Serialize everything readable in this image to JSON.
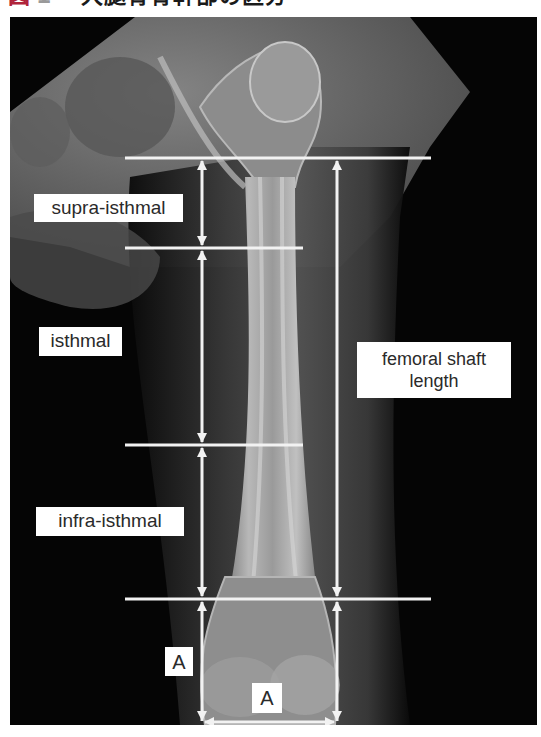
{
  "caption": {
    "marker": "図",
    "number": "1",
    "title": "大腿骨骨幹部の区分",
    "marker_color": "#b0243a"
  },
  "figure": {
    "type": "radiograph",
    "line_color": "#f2f2f2",
    "labels": {
      "supra_isthmal": "supra-isthmal",
      "isthmal": "isthmal",
      "infra_isthmal": "infra-isthmal",
      "femoral_shaft_length_line1": "femoral shaft",
      "femoral_shaft_length_line2": "length",
      "a_vertical": "A",
      "a_horizontal": "A"
    },
    "measurement_lines_y": [
      158,
      248,
      445,
      599
    ],
    "vertical_arrows_x": [
      202,
      337
    ]
  }
}
